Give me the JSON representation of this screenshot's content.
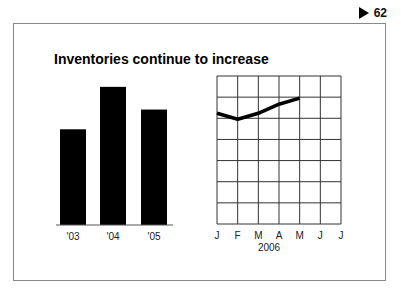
{
  "page": {
    "number": "62",
    "indicator_icon": "triangle-right-icon"
  },
  "title": "Inventories continue to increase",
  "chart_data": [
    {
      "type": "bar",
      "title": "Inventories continue to increase",
      "categories": [
        "'03",
        "'04",
        "'05"
      ],
      "values": [
        97,
        140,
        117
      ],
      "xlabel": "",
      "ylabel": "",
      "ylim": [
        0,
        150
      ],
      "grid": false,
      "color": "#000000"
    },
    {
      "type": "line",
      "x": [
        "J",
        "F",
        "M",
        "A",
        "M",
        "J",
        "J"
      ],
      "values": [
        110,
        104,
        110,
        119,
        125,
        null,
        null
      ],
      "xlabel": "2006",
      "ylabel": "",
      "ylim": [
        0,
        147
      ],
      "grid": true,
      "grid_rows": 7,
      "grid_cols": 6,
      "color": "#000000"
    }
  ]
}
